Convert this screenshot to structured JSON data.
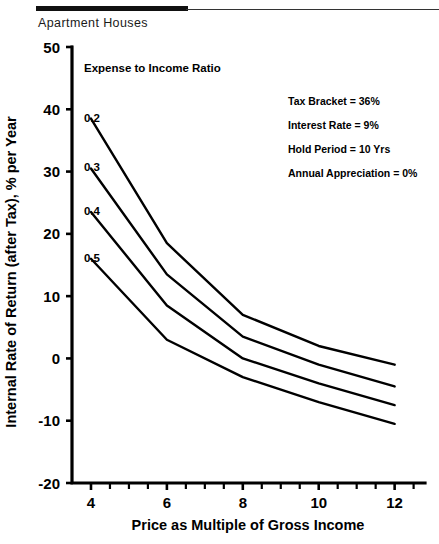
{
  "page_title": "Apartment Houses",
  "chart_data": {
    "type": "line",
    "title": "Apartment Houses",
    "xlabel": "Price as Multiple of Gross Income",
    "ylabel": "Internal Rate of Return (after Tax), % per Year",
    "x": [
      4,
      6,
      8,
      10,
      12
    ],
    "xlim": [
      3.5,
      12.8
    ],
    "ylim": [
      -20,
      50
    ],
    "xticks": [
      4,
      6,
      8,
      10,
      12
    ],
    "xtick_labels": [
      "4",
      "6",
      "8",
      "10",
      "12"
    ],
    "xticks_minor": [
      4.5,
      5,
      5.5,
      6.5,
      7,
      7.5,
      8.5,
      9,
      9.5,
      10.5,
      11,
      11.5,
      12.5
    ],
    "yticks": [
      50,
      40,
      30,
      20,
      10,
      0,
      -10,
      -20
    ],
    "ytick_labels": [
      "50",
      "40",
      "30",
      "20",
      "10",
      "0",
      "-10",
      "-20"
    ],
    "grid": false,
    "legend_title": "Expense to Income Ratio",
    "legend_position": "inline-left-of-curves",
    "series": [
      {
        "name": "0.2",
        "label": "0.2",
        "values": [
          38.5,
          18.5,
          7.0,
          2.0,
          -1.0
        ]
      },
      {
        "name": "0.3",
        "label": "0.3",
        "values": [
          30.5,
          13.5,
          3.5,
          -1.0,
          -4.5
        ]
      },
      {
        "name": "0.4",
        "label": "0.4",
        "values": [
          23.5,
          8.5,
          0.0,
          -4.0,
          -7.5
        ]
      },
      {
        "name": "0.5",
        "label": "0.5",
        "values": [
          16.0,
          3.0,
          -3.0,
          -7.0,
          -10.5
        ]
      }
    ],
    "annotations": [
      "Tax Bracket = 36%",
      "Interest Rate = 9%",
      "Hold Period = 10 Yrs",
      "Annual Appreciation = 0%"
    ]
  },
  "annotations": {
    "tax_bracket": "Tax Bracket = 36%",
    "interest_rate": "Interest Rate = 9%",
    "hold_period": "Hold Period = 10 Yrs",
    "annual_appreciation": "Annual Appreciation = 0%"
  },
  "colors": {
    "ink": "#000000",
    "background": "#ffffff",
    "title_text": "#1a1a1a"
  }
}
